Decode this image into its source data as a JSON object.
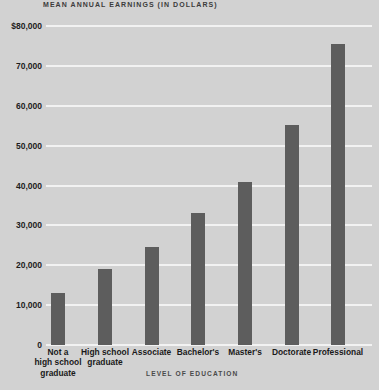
{
  "chart_data": {
    "type": "bar",
    "title": "MEAN ANNUAL EARNINGS (IN DOLLARS)",
    "xlabel": "LEVEL OF EDUCATION",
    "ylabel": "",
    "categories": [
      "Not a\nhigh school\ngraduate",
      "High school\ngraduate",
      "Associate",
      "Bachelor's",
      "Master's",
      "Doctorate",
      "Professional"
    ],
    "values": [
      13000,
      19000,
      24500,
      33000,
      41000,
      55300,
      75500
    ],
    "ylim": [
      0,
      80000
    ],
    "ytick_values": [
      0,
      10000,
      20000,
      30000,
      40000,
      50000,
      60000,
      70000,
      80000
    ],
    "ytick_labels": [
      "0",
      "10,000",
      "20,000",
      "30,000",
      "40,000",
      "50,000",
      "60,000",
      "70,000",
      "$80,000"
    ],
    "grid": true,
    "legend": false,
    "colors": {
      "background": "#d2d2d2",
      "bar": "#5d5d5d",
      "gridline": "#f2f2f2",
      "text": "#1a1a1a"
    }
  }
}
